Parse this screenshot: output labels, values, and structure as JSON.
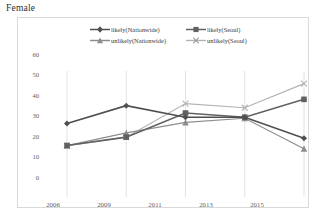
{
  "page": {
    "title": "Female"
  },
  "chart_data": {
    "type": "line",
    "title": "Female",
    "xlabel": "",
    "ylabel": "",
    "categories": [
      "2006",
      "2009",
      "2011",
      "2013",
      "2015"
    ],
    "x": [
      2006,
      2009,
      2011,
      2013,
      2015
    ],
    "ylim": [
      0,
      60
    ],
    "yticks": [
      0,
      10,
      20,
      30,
      40,
      50,
      60
    ],
    "grid": "vertical",
    "legend_position": "top",
    "series": [
      {
        "name": "likely(Nationwide)",
        "marker": "diamond",
        "color": "#4f4f4f",
        "values": [
          35,
          43.5,
          38,
          38,
          28
        ]
      },
      {
        "name": "likely(Seoul)",
        "marker": "square",
        "color": "#616161",
        "values": [
          24.5,
          28.5,
          40,
          38,
          46.5
        ]
      },
      {
        "name": "unlikely(Nationwide)",
        "marker": "triangle",
        "color": "#8d8d8d",
        "values": [
          24.5,
          30.5,
          35.5,
          37.5,
          23
        ]
      },
      {
        "name": "unlikely(Seoul)",
        "marker": "cross",
        "color": "#b3b3b3",
        "values": [
          24.5,
          28.5,
          44.5,
          42.5,
          54
        ]
      }
    ]
  },
  "axis": {
    "y_labels": [
      "60",
      "50",
      "40",
      "30",
      "20",
      "10",
      "0"
    ],
    "x_labels": [
      "2006",
      "2009",
      "2011",
      "2013",
      "2015"
    ]
  },
  "colors": {
    "frame": "#d9d9d9",
    "gridline": "#dcdcdc",
    "axis_text": "#5d5d5d",
    "title_text": "#2d2d2d"
  }
}
